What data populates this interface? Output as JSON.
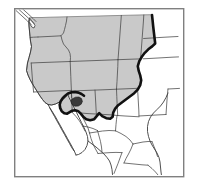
{
  "figure": {
    "kind": "distribution-range-map",
    "region": "Western United States and northern Mexico",
    "width": 198,
    "height": 190,
    "background_color": "#ffffff"
  },
  "frame": {
    "name": "map-border-frame",
    "stroke_color": "#808080",
    "fill_color": "#ffffff",
    "x": 14,
    "y": 8,
    "width": 169,
    "height": 168,
    "stroke_width": 1.4
  },
  "legend_colors": {
    "range_shading": "#c9c9c9",
    "outside_range": "#ffffff",
    "boundary_line": "#444444",
    "range_limit_line": "#111111",
    "population_spot": "#3a3a3a",
    "coastline": "#3c3c3c"
  },
  "map_layers": [
    {
      "name": "range-shading",
      "label": "Shaded distribution range",
      "fill": "#c9c9c9",
      "stroke": "#6e6e6e"
    },
    {
      "name": "state-boundaries",
      "label": "State and province boundaries",
      "stroke": "#4a4a4a"
    },
    {
      "name": "range-limit-line",
      "label": "Bold range limit boundary",
      "stroke": "#111111",
      "stroke_width": 2.6
    },
    {
      "name": "population-spot",
      "label": "Isolated population locality",
      "fill": "#3a3a3a"
    }
  ],
  "shapes": {
    "range_polygon": "M 26.5 70.5 L 27.5 63.0 L 29.0 57.5 L 30.5 52.0 L 31.5 46.5 L 30.5 41.0 L 30.0 36.5 L 29.5 31.0 L 29.0 26.0 L 28.8 21.5 L 29.5 18.0 L 32.0 17.5 L 36.0 17.5 L 42.0 17.5 L 50.0 17.2 L 58.0 17.0 L 66.0 16.8 L 74.0 16.6 L 82.0 16.4 L 90.0 16.2 L 98.0 16.0 L 106.0 15.8 L 114.0 15.6 L 122.0 15.4 L 130.0 15.2 L 138.0 15.0 L 146.0 14.8 L 152.0 14.7 L 152.6 20.0 L 153.2 26.0 L 153.8 32.0 L 154.4 38.0 L 155.0 43.0 L 152.0 46.0 L 148.0 49.0 L 144.5 52.5 L 141.5 56.5 L 139.0 61.0 L 137.5 66.0 L 138.5 71.0 L 140.0 75.5 L 141.0 80.0 L 140.0 85.0 L 137.5 89.5 L 134.0 93.0 L 130.0 96.0 L 126.0 99.0 L 122.0 102.0 L 118.0 105.0 L 115.0 108.5 L 113.0 112.5 L 112.5 116.5 L 110.0 118.5 L 106.0 118.0 L 102.0 116.0 L 99.0 113.0 L 96.5 116.0 L 94.0 119.0 L 90.0 120.0 L 86.0 119.0 L 83.0 116.5 L 80.5 113.5 L 78.0 111.0 L 75.0 110.0 L 72.0 110.5 L 69.5 112.0 L 67.0 113.5 L 64.0 113.0 L 61.5 111.0 L 60.0 108.0 L 59.5 104.5 L 60.5 101.0 L 62.5 98.0 L 65.0 95.5 L 67.5 93.5 L 66.0 96.5 L 63.0 99.5 L 59.5 102.0 L 55.5 104.0 L 51.5 105.0 L 48.0 104.5 L 45.0 102.5 L 42.5 99.5 L 40.0 96.0 L 37.5 92.0 L 35.0 88.0 L 32.5 84.0 L 30.0 79.5 L 28.0 75.0 Z",
    "range_limit_line": "M 152.0 15.0 L 152.6 20.5 L 153.2 26.5 L 153.9 32.5 L 154.6 38.5 L 155.2 43.5 L 152.2 46.4 L 148.3 49.3 L 144.8 52.8 L 141.8 56.8 L 139.3 61.2 L 137.8 66.2 L 138.8 71.2 L 140.3 75.7 L 141.2 80.2 L 140.2 85.2 L 137.7 89.7 L 134.2 93.2 L 130.2 96.2 L 126.2 99.2 L 122.2 102.2 L 118.2 105.2 L 115.2 108.7 L 113.2 112.7 L 112.7 116.7 L 110.2 118.7 L 106.2 118.2 L 102.2 116.2 L 99.2 113.2 L 96.7 116.2 L 94.2 119.2 L 90.2 120.2 L 86.2 119.2 L 83.2 116.7 L 80.7 113.7 L 78.2 111.2 L 75.2 110.2 L 72.2 110.7 L 69.7 112.2 L 67.2 113.7 L 64.2 113.2 L 61.7 111.2 L 60.2 108.2 L 59.7 104.7 L 60.7 101.2 L 62.7 98.2 L 65.2 95.7 L 68.0 93.5 L 71.5 92.2 L 75.0 92.0 L 78.5 92.6 L 81.5 94.0 L 84.0 95.8",
    "coast_pacific": "M 29.5 18.0 L 28.8 21.5 L 29.0 26.0 L 29.5 31.0 L 30.0 36.5 L 30.5 41.0 L 31.5 46.5 L 30.5 52.0 L 29.0 57.5 L 27.5 63.0 L 26.5 70.5 L 28.0 75.0 L 30.0 79.5 L 32.5 84.0 L 35.0 88.0 L 37.5 92.0 L 40.0 96.0 L 42.5 99.5 L 45.0 102.5 L 48.0 104.5 L 51.5 105.0 L 55.5 104.0 L 59.5 102.0 L 63.0 99.5 L 66.0 96.5 L 67.5 93.5",
    "baja_peninsula": "M 48.0 104.5 L 50.0 108.0 L 52.5 112.0 L 55.0 116.0 L 57.5 120.5 L 60.0 125.0 L 62.5 129.5 L 65.0 134.0 L 67.5 138.5 L 70.0 143.0 L 72.5 147.5 L 74.5 151.5 L 76.0 155.0 M 74.5 151.5 L 72.0 148.0 L 69.5 143.5 L 67.0 139.0 L 64.5 134.5 L 62.0 130.0 L 59.5 125.5 L 57.0 121.0 L 54.5 116.5 L 52.0 112.0 L 49.5 107.5",
    "gulf_california": "M 67.5 93.5 L 69.0 97.5 L 71.5 102.5 L 74.0 107.5 L 76.5 112.5 L 79.0 117.5 L 81.5 122.5 L 84.0 127.5 L 86.0 132.0 L 87.5 136.5 L 88.0 141.0 L 87.0 145.5 L 85.0 149.5 L 82.0 152.5 L 78.5 154.5 L 76.0 155.0",
    "mexico_west_coast": "M 88.0 141.0 L 92.0 144.0 L 96.0 147.0 L 100.0 150.5 L 104.0 154.0 L 107.0 157.5 L 109.5 161.0 L 111.0 165.0 L 112.0 169.5 L 112.5 174.5",
    "mexico_east_coast": "M 168.0 93.0 L 166.0 97.5 L 163.5 102.0 L 160.5 106.0 L 157.0 109.5 L 153.5 113.0 L 150.5 117.0 L 148.5 121.5 L 147.5 126.5 L 147.5 131.5 L 148.5 136.5 L 150.0 141.0 L 152.0 145.0 L 154.5 149.0 L 157.0 153.0 L 159.0 157.5 L 160.0 162.0 L 160.5 167.0 L 161.0 172.0 L 161.5 175.5",
    "population_spot": "M 72.0 99.0 L 75.5 97.2 L 79.0 97.0 L 81.5 98.6 L 82.4 101.4 L 81.2 104.2 L 78.4 106.0 L 75.0 106.2 L 72.2 104.8 L 71.0 102.0 Z",
    "puget_sound": "M 29.5 18.0 L 31.5 20.5 L 33.5 23.0 L 35.0 25.5 L 34.0 28.0 L 31.8 27.0 L 30.2 24.5 L 29.4 21.5 Z",
    "vancouver_lines": [
      "M 16.0 10.5 L 22.0 16.0 L 27.5 21.0 L 31.5 25.0",
      "M 19.0 9.5 L 25.0 15.0 L 30.5 20.0 L 34.0 23.5",
      "M 22.5 8.8 L 28.0 13.8 L 33.0 18.5 L 36.0 21.5"
    ]
  },
  "state_boundaries": [
    "M 38.0 37.0 L 46.0 36.6 L 54.0 36.2 L 61.0 35.8 L 63.5 33.0 L 64.5 29.5 L 65.5 25.5 L 66.5 21.0 L 67.0 17.0",
    "M 38.0 37.0 L 33.5 37.2 L 30.3 37.4",
    "M 61.0 35.8 L 62.0 40.0 L 63.5 44.0 L 66.0 47.0 L 68.5 50.0 L 70.0 53.5 L 70.5 57.5 L 70.2 61.5",
    "M 70.2 61.5 L 78.0 61.2 L 86.0 60.9 L 94.0 60.6 L 102.0 60.3 L 110.0 60.0 L 118.0 59.7",
    "M 70.2 61.5 L 62.0 61.8 L 54.0 62.1 L 46.0 62.4 L 38.0 62.7 L 31.2 63.0",
    "M 118.0 59.7 L 118.6 52.0 L 119.2 44.0 L 119.8 36.0 L 120.4 28.0 L 121.0 20.0 L 121.3 15.4",
    "M 118.0 59.7 L 126.0 59.4 L 134.0 59.1 L 140.5 58.9",
    "M 140.5 58.9 L 141.2 51.0 L 141.8 43.0 L 142.4 35.0 L 143.0 27.0 L 143.5 20.0 L 143.8 15.0",
    "M 143.6 38.5 L 151.5 38.0 L 158.0 37.6 L 165.0 37.2 L 172.0 36.8 L 178.0 36.5",
    "M 143.3 58.8 L 151.0 58.4 L 158.0 58.0 L 165.0 57.6 L 172.0 57.2 L 178.5 56.9",
    "M 31.2 63.0 L 31.8 71.0 L 32.4 79.0 L 33.0 86.0 L 33.6 92.0",
    "M 70.2 61.5 L 70.5 69.0 L 70.8 76.5 L 71.1 84.0 L 71.4 91.0 L 71.7 97.5",
    "M 33.6 92.0 L 41.0 91.7 L 48.0 91.4 L 55.0 91.1 L 62.0 90.8 L 69.0 90.5 L 71.4 90.4",
    "M 71.4 91.0 L 79.0 90.7 L 87.0 90.4 L 95.0 90.1 L 103.0 89.8 L 110.0 89.5 L 116.5 89.2",
    "M 116.5 89.2 L 117.0 81.5 L 117.4 74.0 L 117.8 66.5 L 118.0 59.7",
    "M 116.5 89.2 L 124.0 88.9 L 131.0 88.6 L 137.5 88.3",
    "M 137.5 88.3 L 138.0 96.0 L 138.4 103.0 L 138.8 110.0 L 139.0 116.0",
    "M 139.0 116.0 L 146.0 115.6 L 153.0 115.2 L 160.0 114.8 L 166.0 114.5",
    "M 166.0 114.5 L 166.5 107.0 L 167.0 100.0 L 167.5 93.5 L 168.0 89.0",
    "M 168.0 89.0 L 174.0 88.7 L 179.5 88.4",
    "M 71.4 91.0 L 71.7 98.5 L 72.0 106.0 L 72.3 112.5",
    "M 116.5 89.2 L 116.8 96.5 L 117.1 103.5 L 117.4 110.0 L 117.7 115.5",
    "M 95.0 90.1 L 95.4 97.0 L 95.8 104.0 L 96.1 110.0 L 96.4 115.0",
    "M 81.0 113.0 L 88.0 113.6 L 95.8 114.0 L 103.0 114.4 L 110.0 114.8 L 117.7 115.5",
    "M 117.7 115.5 L 125.0 116.0 L 132.0 116.4 L 139.0 116.8",
    "M 81.0 113.0 L 83.0 118.0 L 85.5 123.0 L 88.0 128.0 L 89.5 133.0",
    "M 89.5 133.0 L 96.0 132.0 L 102.5 131.0 L 109.0 130.5 L 115.5 130.8",
    "M 115.5 130.8 L 116.0 124.5 L 116.5 119.5 L 117.0 116.0",
    "M 115.5 130.8 L 121.0 133.5 L 126.0 136.5 L 130.0 140.0 L 133.0 144.0",
    "M 133.0 144.0 L 138.0 143.0 L 143.0 142.0 L 148.0 141.5 L 152.0 141.6",
    "M 133.0 144.0 L 131.0 149.0 L 128.5 154.0 L 126.0 158.5 L 124.0 163.0",
    "M 124.0 163.0 L 130.0 163.6 L 136.0 164.2 L 142.0 164.8 L 148.0 165.2",
    "M 89.5 133.0 L 91.0 138.5 L 93.0 144.0 L 95.5 149.0 L 98.0 153.5",
    "M 98.0 153.5 L 104.0 153.0 L 110.0 152.6 L 116.0 152.4 L 122.0 152.6",
    "M 72.3 112.5 L 76.0 116.5 L 79.5 121.0 L 82.5 126.0 L 85.0 131.0",
    "M 82.5 126.0 L 88.0 127.0 L 93.0 128.5 L 97.5 130.5",
    "M 152.0 141.6 L 154.0 146.5 L 156.0 151.5 L 157.5 156.5",
    "M 148.0 165.2 L 152.0 168.5 L 155.5 172.0 L 158.0 175.0",
    "M 122.0 152.6 L 120.0 158.0 L 118.0 163.5 L 116.0 168.5 L 114.0 173.5",
    "M 97.5 130.5 L 99.0 136.0 L 100.5 141.5 L 101.5 147.0 L 102.0 152.0"
  ],
  "map_border_states": {
    "note": "Thin outer boundary lines of the mapped landmass",
    "canada_border_y": 16.5,
    "mexico_border_label": "international boundary"
  }
}
